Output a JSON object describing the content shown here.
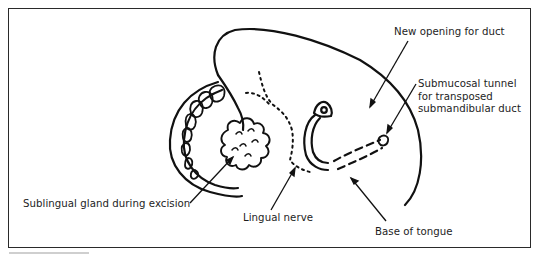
{
  "figure": {
    "type": "anatomical-line-drawing",
    "labels": {
      "new_opening": "New opening for duct",
      "tunnel_line1": "Submucosal tunnel",
      "tunnel_line2": "for transposed",
      "tunnel_line3": "submandibular duct",
      "sublingual_gland": "Sublingual gland during excision",
      "lingual_nerve": "Lingual nerve",
      "base_of_tongue": "Base of tongue"
    },
    "colors": {
      "line": "#111111",
      "frame": "#2a2a2a",
      "background": "#ffffff"
    }
  }
}
